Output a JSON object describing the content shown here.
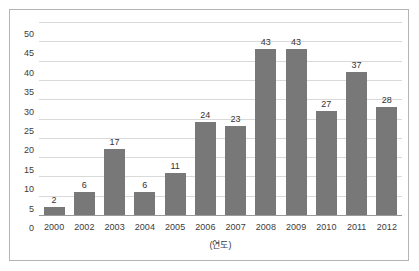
{
  "chart_data": {
    "type": "bar",
    "title": "",
    "subtitle": "",
    "xlabel": "(연도)",
    "ylabel": "",
    "categories": [
      "2000",
      "2002",
      "2003",
      "2004",
      "2005",
      "2006",
      "2007",
      "2008",
      "2009",
      "2010",
      "2011",
      "2012"
    ],
    "values": [
      2,
      6,
      17,
      6,
      11,
      24,
      23,
      43,
      43,
      27,
      37,
      28
    ],
    "value_labels": [
      "2",
      "6",
      "17",
      "6",
      "11",
      "24",
      "23",
      "43",
      "43",
      "27",
      "37",
      "28"
    ],
    "ylim": [
      0,
      50
    ],
    "ytick_step": 5,
    "ytick_labels": [
      "50",
      "45",
      "40",
      "35",
      "30",
      "25",
      "20",
      "15",
      "10",
      "5",
      "0"
    ],
    "grid": true,
    "grid_axis": "y",
    "legend": false,
    "legend_position": "none",
    "bar_color": "#787878",
    "gridline_color": "#d9d9d9",
    "axis_color": "#9a9a9a",
    "text_color": "#3b3b3b",
    "background_color": "#ffffff",
    "border_color": "#b4b4b4"
  }
}
